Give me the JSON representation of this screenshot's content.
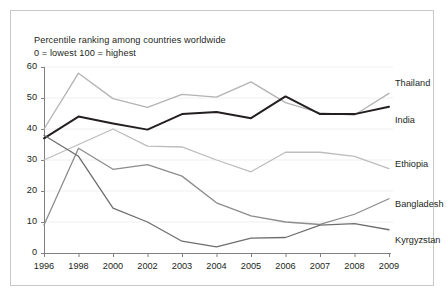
{
  "figure": {
    "caption_line1": "Percentile ranking among countries worldwide",
    "caption_line2": "0 = lowest 100 = highest"
  },
  "chart_data": {
    "type": "line",
    "title": "Percentile ranking among countries worldwide",
    "subtitle": "0 = lowest 100 = highest",
    "xlabel": "",
    "ylabel": "",
    "categories": [
      "1996",
      "1998",
      "2000",
      "2002",
      "2003",
      "2004",
      "2005",
      "2006",
      "2007",
      "2008",
      "2009"
    ],
    "ylim": [
      0,
      60
    ],
    "yticks": [
      0,
      10,
      20,
      30,
      40,
      50,
      60
    ],
    "grid": true,
    "legend_position": "right-inline",
    "series": [
      {
        "name": "Thailand",
        "color": "#b3b3b3",
        "width": 1.3,
        "values": [
          40.0,
          58.0,
          49.8,
          47.0,
          51.2,
          50.3,
          55.2,
          48.5,
          45.2,
          44.5,
          51.5
        ]
      },
      {
        "name": "India",
        "color": "#231f20",
        "width": 2.0,
        "values": [
          37.0,
          44.0,
          41.8,
          39.8,
          44.8,
          45.5,
          43.5,
          50.5,
          44.8,
          44.8,
          47.2
        ]
      },
      {
        "name": "Ethiopia",
        "color": "#bdbdbd",
        "width": 1.3,
        "values": [
          30.0,
          35.0,
          40.0,
          34.5,
          34.2,
          30.0,
          26.2,
          32.5,
          32.5,
          31.2,
          27.2
        ]
      },
      {
        "name": "Bangladesh",
        "color": "#8c8c8c",
        "width": 1.3,
        "values": [
          9.0,
          33.8,
          27.0,
          28.5,
          24.8,
          16.2,
          12.0,
          10.0,
          9.2,
          12.5,
          17.5
        ]
      },
      {
        "name": "Kyrgyzstan",
        "color": "#6e6e6e",
        "width": 1.3,
        "values": [
          38.0,
          31.2,
          14.5,
          10.0,
          3.8,
          2.0,
          4.8,
          5.0,
          9.0,
          9.5,
          7.5
        ]
      }
    ]
  },
  "axes": {
    "y_labels": [
      "60",
      "50",
      "40",
      "30",
      "20",
      "10",
      "0"
    ],
    "x_labels": [
      "1996",
      "1998",
      "2000",
      "2002",
      "2003",
      "2004",
      "2005",
      "2006",
      "2007",
      "2008",
      "2009"
    ]
  },
  "legend": {
    "items": [
      {
        "label": "Thailand"
      },
      {
        "label": "India"
      },
      {
        "label": "Ethiopia"
      },
      {
        "label": "Bangladesh"
      },
      {
        "label": "Kyrgyzstan"
      }
    ]
  },
  "colors": {
    "axis": "#808080",
    "grid": "#efefef",
    "text": "#231f20",
    "frame": "#c9c9c9",
    "background": "#ffffff"
  }
}
